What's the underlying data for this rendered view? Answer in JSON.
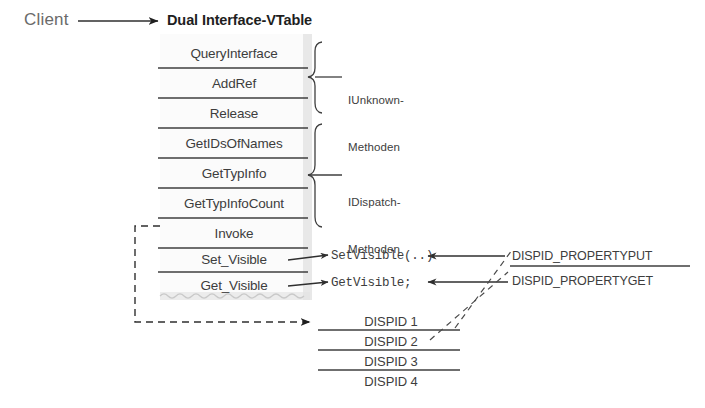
{
  "diagram": {
    "title": "Dual Interface-VTable",
    "client_label": "Client",
    "background": "#ffffff",
    "ink": "#3d3d3d",
    "shadow": "#d9d9d9"
  },
  "vtable": {
    "heading": "Dual Interface-VTable",
    "rows": [
      {
        "label": "QueryInterface"
      },
      {
        "label": "AddRef"
      },
      {
        "label": "Release"
      },
      {
        "label": "GetIDsOfNames"
      },
      {
        "label": "GetTypInfo"
      },
      {
        "label": "GetTypInfoCount"
      },
      {
        "label": "Invoke"
      },
      {
        "label": "Set_Visible"
      },
      {
        "label": "Get_Visible"
      }
    ]
  },
  "groups": [
    {
      "name": "iunknown",
      "line1": "IUnknown-",
      "line2": "Methoden"
    },
    {
      "name": "idispatch",
      "line1": "IDispatch-",
      "line2": "Methoden"
    }
  ],
  "implementations": [
    {
      "name": "set-visible-impl",
      "label": "SetVisible(..)"
    },
    {
      "name": "get-visible-impl",
      "label": "GetVisible;"
    }
  ],
  "dispid_table": {
    "rows": [
      {
        "label": "DISPID 1"
      },
      {
        "label": "DISPID 2"
      },
      {
        "label": "DISPID 3"
      },
      {
        "label": "DISPID 4"
      }
    ]
  },
  "dispid_constants": [
    {
      "name": "dispid-propertyput",
      "label": "DISPID_PROPERTYPUT"
    },
    {
      "name": "dispid-propertyget",
      "label": "DISPID_PROPERTYGET"
    }
  ]
}
